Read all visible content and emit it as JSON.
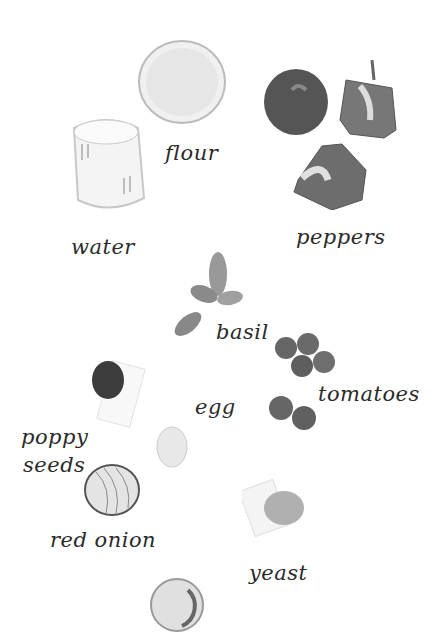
{
  "labels": {
    "flour": "flour",
    "water": "water",
    "peppers": "peppers",
    "basil": "basil",
    "tomatoes": "tomatoes",
    "egg": "egg",
    "poppy_line1": "poppy",
    "poppy_line2": "seeds",
    "red_onion": "red onion",
    "yeast": "yeast"
  },
  "items": [
    "flour-bowl",
    "water-jug",
    "peppers",
    "basil-leaves",
    "tomatoes",
    "poppy-seeds",
    "egg",
    "red-onion",
    "yeast",
    "oil-dish"
  ],
  "colors": {
    "background": "#ffffff",
    "text": "#2a2a2a"
  }
}
